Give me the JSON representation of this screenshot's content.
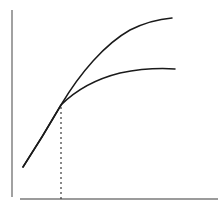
{
  "chart_data": {
    "type": "line",
    "title": "",
    "subtitle": "",
    "xlabel": "",
    "ylabel": "",
    "xlim": [
      0,
      223
    ],
    "ylim": [
      0,
      211
    ],
    "grid": false,
    "legend": "none",
    "legend_entries": [],
    "tick_labels": {
      "x": [],
      "y": []
    },
    "annotations": [],
    "background_color": "#ffffff",
    "axes": {
      "x_axis": {
        "name": "x-axis",
        "color": "#7a7a7a",
        "width": 1.6,
        "x1": 20,
        "y1": 199,
        "x2": 218,
        "y2": 199
      },
      "y_axis": {
        "name": "y-axis",
        "color": "#8a8a8a",
        "width": 1.6,
        "x1": 12,
        "y1": 10,
        "x2": 12,
        "y2": 197
      }
    },
    "series": [
      {
        "name": "upper-curve",
        "color": "#1a1a1a",
        "width": 1.5,
        "dash": "none",
        "shape": "concave-down",
        "path": "M 23 167 C 36 147, 50 124, 61 105 C 80 73, 105 44, 130 30 C 146 22, 160 19, 172 18",
        "start_point": [
          23,
          167
        ],
        "end_point": [
          172,
          18
        ],
        "points": [
          [
            23,
            167
          ],
          [
            35,
            148
          ],
          [
            47,
            128
          ],
          [
            61,
            105
          ],
          [
            75,
            84
          ],
          [
            92,
            63
          ],
          [
            110,
            46
          ],
          [
            130,
            31
          ],
          [
            150,
            23
          ],
          [
            172,
            18
          ]
        ]
      },
      {
        "name": "lower-curve",
        "color": "#1a1a1a",
        "width": 1.5,
        "dash": "none",
        "shape": "concave-down",
        "path": "M 23 167 C 36 147, 50 124, 61 105 C 76 90, 96 79, 120 73 C 140 69, 160 68, 175 69",
        "start_point": [
          23,
          167
        ],
        "end_point": [
          175,
          69
        ],
        "points": [
          [
            23,
            167
          ],
          [
            35,
            148
          ],
          [
            47,
            127
          ],
          [
            61,
            105
          ],
          [
            76,
            92
          ],
          [
            95,
            81
          ],
          [
            120,
            74
          ],
          [
            145,
            70
          ],
          [
            160,
            69
          ],
          [
            175,
            69
          ]
        ]
      }
    ],
    "guides": [
      {
        "name": "intersection-dropline",
        "color": "#3a3a3a",
        "width": 1.2,
        "dash": "2 3",
        "x1": 61,
        "y1": 107,
        "x2": 61,
        "y2": 200
      }
    ],
    "markers": [
      {
        "name": "intersection-point",
        "x": 61,
        "y": 105
      }
    ]
  }
}
